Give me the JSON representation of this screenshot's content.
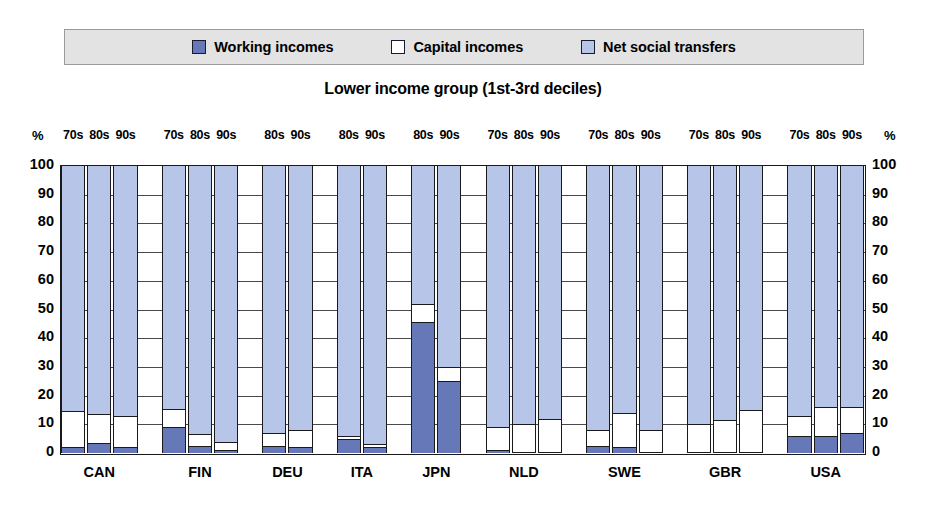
{
  "legend": {
    "items": [
      {
        "label": "Working incomes",
        "color": "#6678b8",
        "icon": "square-swatch-icon"
      },
      {
        "label": "Capital incomes",
        "color": "#ffffff",
        "icon": "square-swatch-icon"
      },
      {
        "label": "Net social transfers",
        "color": "#b6c5e8",
        "icon": "square-swatch-icon"
      }
    ]
  },
  "title": "Lower income group (1st-3rd deciles)",
  "axis": {
    "unit_left": "%",
    "unit_right": "%",
    "ticks": [
      "100",
      "90",
      "80",
      "70",
      "60",
      "50",
      "40",
      "30",
      "20",
      "10",
      "0"
    ]
  },
  "chart_data": {
    "type": "bar",
    "title": "Lower income group (1st-3rd deciles)",
    "xlabel": "",
    "ylabel": "%",
    "ylim": [
      0,
      100
    ],
    "yticks": [
      0,
      10,
      20,
      30,
      40,
      50,
      60,
      70,
      80,
      90,
      100
    ],
    "grid": true,
    "stacked": true,
    "stack_total": 100,
    "legend_position": "top",
    "series": [
      {
        "name": "Working incomes",
        "color": "#6678b8"
      },
      {
        "name": "Capital incomes",
        "color": "#ffffff"
      },
      {
        "name": "Net social transfers",
        "color": "#b6c5e8"
      }
    ],
    "categories": [
      "CAN",
      "FIN",
      "DEU",
      "ITA",
      "JPN",
      "NLD",
      "SWE",
      "GBR",
      "USA"
    ],
    "groups": [
      {
        "country": "CAN",
        "bars": [
          {
            "decade": "70s",
            "working": 2.0,
            "capital": 12.5,
            "transfers": 85.5
          },
          {
            "decade": "80s",
            "working": 3.5,
            "capital": 10.0,
            "transfers": 86.5
          },
          {
            "decade": "90s",
            "working": 2.0,
            "capital": 11.0,
            "transfers": 87.0
          }
        ]
      },
      {
        "country": "FIN",
        "bars": [
          {
            "decade": "70s",
            "working": 9.0,
            "capital": 6.5,
            "transfers": 84.5
          },
          {
            "decade": "80s",
            "working": 2.5,
            "capital": 4.0,
            "transfers": 93.5
          },
          {
            "decade": "90s",
            "working": 1.0,
            "capital": 3.0,
            "transfers": 96.0
          }
        ]
      },
      {
        "country": "DEU",
        "bars": [
          {
            "decade": "80s",
            "working": 2.5,
            "capital": 4.5,
            "transfers": 93.0
          },
          {
            "decade": "90s",
            "working": 2.0,
            "capital": 6.0,
            "transfers": 92.0
          }
        ]
      },
      {
        "country": "ITA",
        "bars": [
          {
            "decade": "80s",
            "working": 5.0,
            "capital": 1.0,
            "transfers": 94.0
          },
          {
            "decade": "90s",
            "working": 2.0,
            "capital": 1.0,
            "transfers": 97.0
          }
        ]
      },
      {
        "country": "JPN",
        "bars": [
          {
            "decade": "80s",
            "working": 45.5,
            "capital": 6.5,
            "transfers": 48.0
          },
          {
            "decade": "90s",
            "working": 25.0,
            "capital": 5.0,
            "transfers": 70.0
          }
        ]
      },
      {
        "country": "NLD",
        "bars": [
          {
            "decade": "70s",
            "working": 1.0,
            "capital": 8.0,
            "transfers": 91.0
          },
          {
            "decade": "80s",
            "working": 0.5,
            "capital": 9.5,
            "transfers": 90.0
          },
          {
            "decade": "90s",
            "working": 0.5,
            "capital": 11.5,
            "transfers": 88.0
          }
        ]
      },
      {
        "country": "SWE",
        "bars": [
          {
            "decade": "70s",
            "working": 2.5,
            "capital": 5.5,
            "transfers": 92.0
          },
          {
            "decade": "80s",
            "working": 2.0,
            "capital": 12.0,
            "transfers": 86.0
          },
          {
            "decade": "90s",
            "working": 0.5,
            "capital": 7.5,
            "transfers": 92.0
          }
        ]
      },
      {
        "country": "GBR",
        "bars": [
          {
            "decade": "70s",
            "working": 0.5,
            "capital": 9.5,
            "transfers": 90.0
          },
          {
            "decade": "80s",
            "working": 0.5,
            "capital": 11.0,
            "transfers": 88.5
          },
          {
            "decade": "90s",
            "working": 0.5,
            "capital": 14.5,
            "transfers": 85.0
          }
        ]
      },
      {
        "country": "USA",
        "bars": [
          {
            "decade": "70s",
            "working": 6.0,
            "capital": 7.0,
            "transfers": 87.0
          },
          {
            "decade": "80s",
            "working": 6.0,
            "capital": 10.0,
            "transfers": 84.0
          },
          {
            "decade": "90s",
            "working": 7.0,
            "capital": 9.0,
            "transfers": 84.0
          }
        ]
      }
    ]
  }
}
